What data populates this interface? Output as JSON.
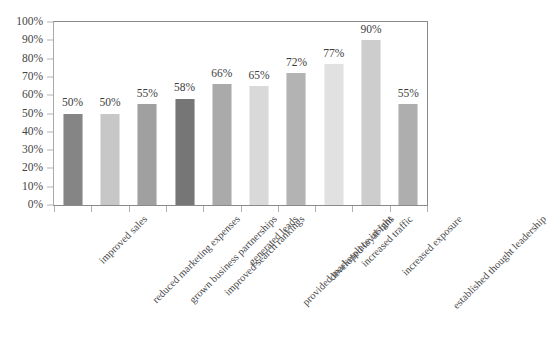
{
  "chart_data": {
    "type": "bar",
    "title": "",
    "xlabel": "",
    "ylabel": "",
    "ylim": [
      0,
      100
    ],
    "grid": false,
    "legend": "none",
    "value_suffix": "%",
    "categories": [
      "improved sales",
      "reduced marketing expenses",
      "grown business partnerships",
      "improved search rankings",
      "generated leads",
      "provided marketplace insight",
      "developed loyal fans",
      "increased traffic",
      "increased exposure",
      "established thought leadership"
    ],
    "values": [
      50,
      50,
      55,
      58,
      66,
      65,
      72,
      77,
      90,
      55
    ],
    "value_labels": [
      "50%",
      "50%",
      "55%",
      "58%",
      "66%",
      "65%",
      "72%",
      "77%",
      "90%",
      "55%"
    ],
    "bar_colors": [
      "#6f6f6f",
      "#bdbdbd",
      "#8f8f8f",
      "#5e5e5e",
      "#9b9b9b",
      "#d2d2d2",
      "#a6a6a6",
      "#dcdcdc",
      "#c4c4c4",
      "#a0a0a0"
    ],
    "y_ticks": [
      0,
      10,
      20,
      30,
      40,
      50,
      60,
      70,
      80,
      90,
      100
    ],
    "y_tick_labels": [
      "0%",
      "10%",
      "20%",
      "30%",
      "40%",
      "50%",
      "60%",
      "70%",
      "80%",
      "90%",
      "100%"
    ]
  },
  "axis": {
    "frame_color": "#8a8a8a",
    "tick_color": "#b0b0b0"
  },
  "title_sliver": "",
  "names": {
    "chart": "bar-chart",
    "plot": "plot-area",
    "y_axis": "y-axis",
    "x_axis": "x-axis"
  }
}
